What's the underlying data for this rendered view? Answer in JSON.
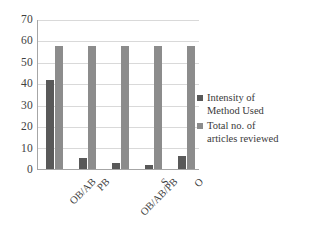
{
  "chart_data": {
    "type": "bar",
    "title": "",
    "subtitle": "",
    "xlabel": "",
    "ylabel": "",
    "categories": [
      "OB/AB",
      "PB",
      "OB/AB/PB",
      "S",
      "O"
    ],
    "series": [
      {
        "name": "Intensity of Method Used",
        "color": "#595959",
        "values": [
          42,
          5,
          3,
          2,
          6
        ]
      },
      {
        "name": "Total no. of articles reviewed",
        "color": "#8c8c8c",
        "values": [
          58,
          58,
          58,
          58,
          58
        ]
      }
    ],
    "ylim": [
      0,
      70
    ],
    "ytick_step": 10,
    "yticks": [
      "70",
      "60",
      "50",
      "40",
      "30",
      "20",
      "10",
      "0"
    ],
    "grid": true,
    "legend_position": "right",
    "xtick_rotation": -45
  },
  "legend": {
    "entries": [
      {
        "label_line1": "Intensity of",
        "label_line2": "Method Used"
      },
      {
        "label_line1": "Total no. of",
        "label_line2": "articles reviewed"
      }
    ]
  },
  "colors": {
    "series1": "#595959",
    "series2": "#8c8c8c",
    "gridline": "#d9d9d9",
    "axis": "#a6a6a6",
    "text": "#3a3a3a",
    "background": "#ffffff"
  }
}
